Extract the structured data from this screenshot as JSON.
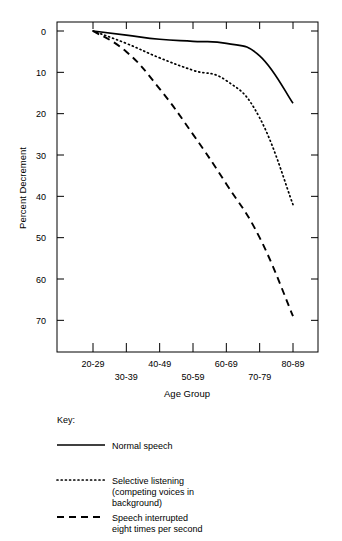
{
  "chart_data": {
    "type": "line",
    "title": "",
    "xlabel": "Age Group",
    "ylabel": "Percent Decrement",
    "categories": [
      "20-29",
      "30-39",
      "40-49",
      "50-59",
      "60-69",
      "70-79",
      "80-89"
    ],
    "ylim": [
      0,
      75
    ],
    "y_inverted": true,
    "yticks": [
      0,
      10,
      20,
      30,
      40,
      50,
      60,
      70
    ],
    "grid": false,
    "legend_position": "below-plot",
    "legend_title": "Key:",
    "series": [
      {
        "name": "Normal speech",
        "style": "solid",
        "color": "#000000",
        "values": [
          0,
          1,
          2,
          2.5,
          3,
          6,
          17.5
        ]
      },
      {
        "name": "Selective listening (competing voices in background)",
        "style": "dotted",
        "color": "#000000",
        "values": [
          0,
          3,
          6.5,
          9.5,
          12,
          21,
          42
        ]
      },
      {
        "name": "Speech interrupted eight times per second",
        "style": "dashed",
        "color": "#000000",
        "values": [
          0,
          5,
          14,
          25,
          37,
          50,
          69
        ]
      }
    ]
  },
  "axes": {
    "x_label": "Age Group",
    "y_label": "Percent Decrement",
    "x_tick_labels": [
      "20-29",
      "30-39",
      "40-49",
      "50-59",
      "60-69",
      "70-79",
      "80-89"
    ],
    "y_tick_labels": [
      "0",
      "10",
      "20",
      "30",
      "40",
      "50",
      "60",
      "70"
    ]
  },
  "legend": {
    "title": "Key:",
    "entries": [
      {
        "label": "Normal speech",
        "line2": "",
        "line3": "",
        "style": "solid"
      },
      {
        "label": "Selective listening",
        "line2": "(competing voices in",
        "line3": "background)",
        "style": "dotted"
      },
      {
        "label": "Speech interrupted",
        "line2": "eight times per second",
        "line3": "",
        "style": "dashed"
      }
    ]
  }
}
